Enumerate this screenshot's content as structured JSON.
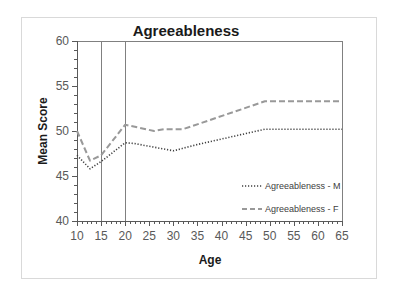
{
  "chart_data": {
    "type": "line",
    "title": "Agreeableness",
    "xlabel": "Age",
    "ylabel": "Mean Score",
    "xlim": [
      10,
      65
    ],
    "ylim": [
      40,
      60
    ],
    "x_ticks": [
      10,
      15,
      20,
      25,
      30,
      35,
      40,
      45,
      50,
      55,
      60,
      65
    ],
    "y_ticks": [
      40,
      45,
      50,
      55,
      60
    ],
    "grid": false,
    "vertical_reference_lines": [
      15,
      20
    ],
    "legend_position": "lower right inside plot",
    "series": [
      {
        "name": "Agreeableness - M",
        "style": "dotted",
        "color": "#404040",
        "points": [
          [
            10,
            47.3
          ],
          [
            12.7,
            45.8
          ],
          [
            15,
            46.6
          ],
          [
            20,
            48.7
          ],
          [
            22,
            48.6
          ],
          [
            30,
            47.8
          ],
          [
            35,
            48.5
          ],
          [
            49,
            50.2
          ],
          [
            65,
            50.2
          ]
        ]
      },
      {
        "name": "Agreeableness - F",
        "style": "dashed",
        "color": "#999999",
        "points": [
          [
            10,
            50.0
          ],
          [
            12.7,
            46.7
          ],
          [
            15,
            47.3
          ],
          [
            20,
            50.7
          ],
          [
            26,
            50.0
          ],
          [
            28,
            50.2
          ],
          [
            32,
            50.2
          ],
          [
            49,
            53.3
          ],
          [
            65,
            53.3
          ]
        ]
      }
    ]
  },
  "labels": {
    "title": "Agreeableness",
    "xlabel": "Age",
    "ylabel": "Mean Score",
    "legend_m": "Agreeableness - M",
    "legend_f": "Agreeableness - F"
  }
}
